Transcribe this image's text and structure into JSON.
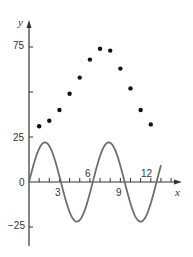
{
  "chart_data": {
    "type": "scatter",
    "title": "",
    "xlabel": "x",
    "ylabel": "y",
    "xlim": [
      0,
      15
    ],
    "ylim": [
      -35,
      85
    ],
    "x_ticks": [
      1,
      2,
      3,
      4,
      5,
      6,
      7,
      8,
      9,
      10,
      11,
      12,
      13,
      14
    ],
    "x_tick_labels": [
      "3",
      "6",
      "9",
      "12"
    ],
    "x_tick_label_values": [
      3,
      6,
      9,
      12
    ],
    "y_tick_labels": [
      "75",
      "25",
      "0",
      "-25"
    ],
    "y_tick_values": [
      75,
      50,
      25,
      0,
      -25
    ],
    "grid": false,
    "series": [
      {
        "name": "data points",
        "kind": "scatter",
        "color": "#111111",
        "x": [
          1,
          2,
          3,
          4,
          5,
          6,
          7,
          8,
          9,
          10,
          11,
          12
        ],
        "y": [
          31,
          34,
          40,
          49,
          58,
          68,
          74,
          73,
          63,
          52,
          40,
          32
        ]
      },
      {
        "name": "sine curve",
        "kind": "line",
        "color": "#6e6e6e",
        "equation": "y = 22 sin(x)",
        "amplitude": 22,
        "x_range": [
          0,
          13
        ]
      }
    ]
  },
  "labels": {
    "y_axis": "y",
    "x_axis": "x",
    "y75": "75",
    "y25": "25",
    "y0": "0",
    "yneg25": "−25",
    "x3": "3",
    "x6": "6",
    "x9": "9",
    "x12": "12"
  }
}
